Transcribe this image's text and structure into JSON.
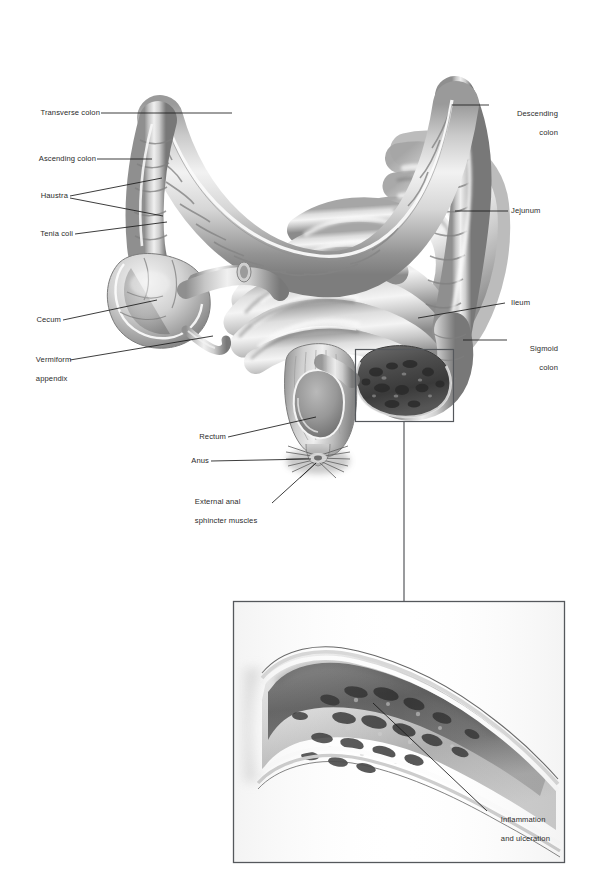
{
  "figure": {
    "width": 599,
    "height": 885,
    "background": "#ffffff",
    "label_color": "#2b2b2b",
    "leader_color": "#1a1a1a",
    "box_color": "#55585c"
  },
  "labels": {
    "transverse_colon": "Transverse colon",
    "ascending_colon": "Ascending colon",
    "haustra": "Haustra",
    "tenia_coli": "Tenia coli",
    "cecum": "Cecum",
    "vermiform_appendix_line1": "Vermiform",
    "vermiform_appendix_line2": "appendix",
    "rectum": "Rectum",
    "anus": "Anus",
    "external_anal_line1": "External anal",
    "external_anal_line2": "sphincter muscles",
    "descending_colon_line1": "Descending",
    "descending_colon_line2": "colon",
    "jejunum": "Jejunum",
    "ileum": "Ileum",
    "sigmoid_colon_line1": "Sigmoid",
    "sigmoid_colon_line2": "colon",
    "inflammation_line1": "Inflammation",
    "inflammation_line2": "and ulceration"
  },
  "callout": {
    "name": "sigmoid-detail-callout",
    "box": {
      "x": 355,
      "y": 349,
      "w": 98,
      "h": 73
    },
    "connector": {
      "x": 404,
      "y1": 422,
      "y2": 601
    }
  },
  "inset": {
    "name": "inflammation-detail-inset",
    "box": {
      "x": 233,
      "y": 601,
      "w": 332,
      "h": 262
    },
    "subject": "cross-section of bowel wall showing mucosal inflammation and ulceration"
  }
}
